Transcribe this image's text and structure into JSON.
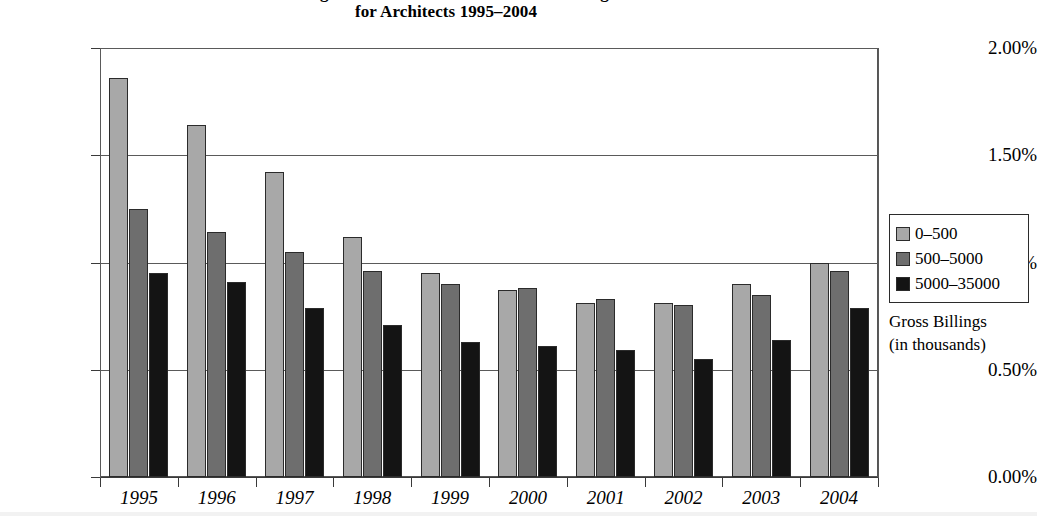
{
  "title": {
    "line1": "Average Ratio of Deductibles to Gross Billings",
    "line2": "for Architects 1995–2004"
  },
  "legend": {
    "caption_line1": "Gross Billings",
    "caption_line2": "(in thousands)",
    "entries": [
      {
        "label": "0–500",
        "color": "#a8a8a8"
      },
      {
        "label": "500–5000",
        "color": "#6e6e6e"
      },
      {
        "label": "5000–35000",
        "color": "#141414"
      }
    ]
  },
  "axes": {
    "y_ticks": [
      "0.00%",
      "0.50%",
      "1.00%",
      "1.50%",
      "2.00%"
    ],
    "x_ticks": [
      "1995",
      "1996",
      "1997",
      "1998",
      "1999",
      "2000",
      "2001",
      "2002",
      "2003",
      "2004"
    ]
  },
  "chart_data": {
    "type": "bar",
    "title": "Average Ratio of Deductibles to Gross Billings for Architects 1995–2004",
    "xlabel": "",
    "ylabel": "",
    "ylim": [
      0,
      2.0
    ],
    "yunit": "%",
    "ytick_values": [
      0.0,
      0.5,
      1.0,
      1.5,
      2.0
    ],
    "grid": true,
    "legend_position": "right",
    "legend_title": "Gross Billings (in thousands)",
    "categories": [
      "1995",
      "1996",
      "1997",
      "1998",
      "1999",
      "2000",
      "2001",
      "2002",
      "2003",
      "2004"
    ],
    "series": [
      {
        "name": "0–500",
        "color": "#a8a8a8",
        "values": [
          1.86,
          1.64,
          1.42,
          1.12,
          0.95,
          0.87,
          0.81,
          0.81,
          0.9,
          1.0
        ]
      },
      {
        "name": "500–5000",
        "color": "#6e6e6e",
        "values": [
          1.25,
          1.14,
          1.05,
          0.96,
          0.9,
          0.88,
          0.83,
          0.8,
          0.85,
          0.96
        ]
      },
      {
        "name": "5000–35000",
        "color": "#141414",
        "values": [
          0.95,
          0.91,
          0.79,
          0.71,
          0.63,
          0.61,
          0.59,
          0.55,
          0.64,
          0.79
        ]
      }
    ]
  }
}
